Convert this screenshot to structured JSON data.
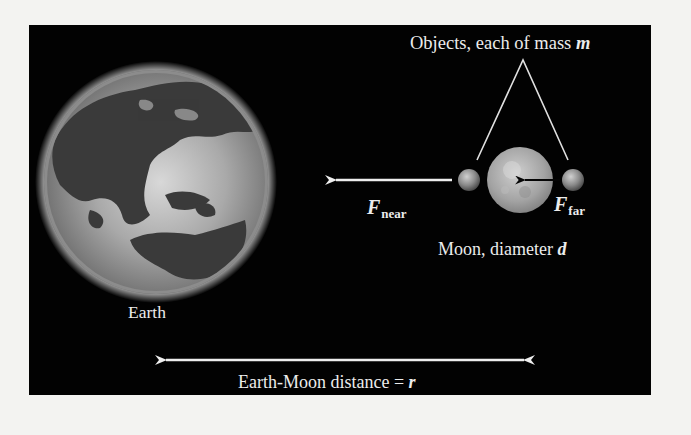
{
  "figure": {
    "background": "#020202",
    "page_background": "#f3f3f1",
    "labels": {
      "objects_title": "Objects, each of mass ",
      "objects_mass_symbol": "m",
      "earth": "Earth",
      "moon_text": "Moon, diameter ",
      "moon_diameter_symbol": "d",
      "force_near_symbol": "F",
      "force_near_subscript": "near",
      "force_far_symbol": "F",
      "force_far_subscript": "far",
      "distance_text": "Earth-Moon distance = ",
      "distance_symbol": "r"
    },
    "elements": [
      {
        "name": "Earth",
        "shape": "globe"
      },
      {
        "name": "Moon",
        "shape": "sphere"
      },
      {
        "name": "near object",
        "shape": "small sphere"
      },
      {
        "name": "far object",
        "shape": "small sphere"
      },
      {
        "name": "F_near arrow",
        "direction": "left"
      },
      {
        "name": "F_far arrow",
        "direction": "left"
      },
      {
        "name": "Earth-Moon distance arrow",
        "direction": "both"
      }
    ]
  }
}
